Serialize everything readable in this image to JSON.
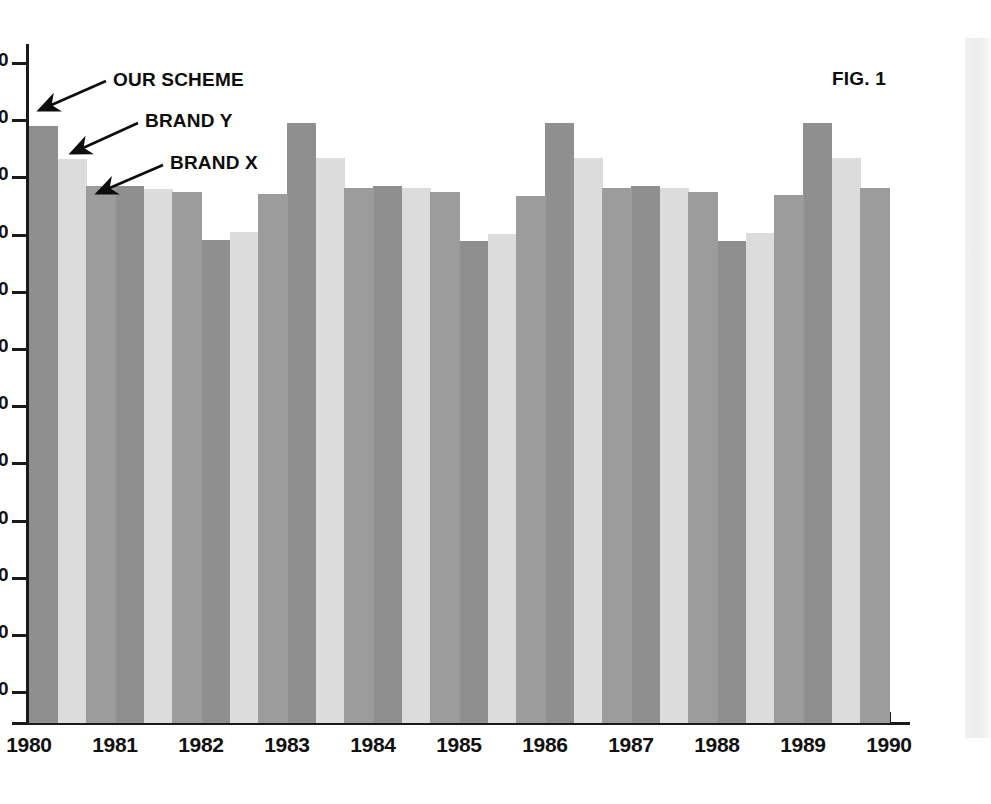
{
  "figure": {
    "number_label": "FIG. 1"
  },
  "annotations": [
    {
      "text": "OUR SCHEME",
      "series": "our-scheme"
    },
    {
      "text": "BRAND Y",
      "series": "brand-y"
    },
    {
      "text": "BRAND X",
      "series": "brand-x"
    }
  ],
  "colors": {
    "our_scheme": "#8f8f8f",
    "brand_y": "#dcdcdc",
    "brand_x": "#9c9c9c",
    "axis": "#1a1a1a",
    "text": "#0d0d0d",
    "background": "#ffffff"
  },
  "chart_data": {
    "type": "bar",
    "title": "FIG. 1",
    "xlabel": "",
    "ylabel": "",
    "grid": false,
    "legend_position": "annotated-arrows",
    "categories": [
      "1980",
      "1981",
      "1982",
      "1983",
      "1984",
      "1985",
      "1986",
      "1987",
      "1988",
      "1989"
    ],
    "axis_tick_labels_x": [
      "1980",
      "1981",
      "1982",
      "1983",
      "1984",
      "1985",
      "1986",
      "1987",
      "1988",
      "1989",
      "1990"
    ],
    "y_tick_labels": [
      "0",
      "0",
      "0",
      "0",
      "0",
      "0",
      "0",
      "0",
      "0",
      "0",
      "0",
      "0"
    ],
    "y_tick_note": "Y-axis numeric labels are clipped by the left edge of the image; only the trailing digit glyph is visible.",
    "ylim": [
      0,
      100
    ],
    "series": [
      {
        "name": "OUR SCHEME",
        "key": "our-scheme",
        "color": "#8f8f8f",
        "values": [
          88,
          82,
          72,
          89,
          81,
          72,
          89,
          81,
          72,
          89
        ]
      },
      {
        "name": "BRAND Y",
        "key": "brand-y",
        "color": "#dcdcdc",
        "values": [
          84,
          81,
          74,
          84,
          81,
          75,
          84,
          81,
          75,
          84
        ]
      },
      {
        "name": "BRAND X",
        "key": "brand-x",
        "color": "#9c9c9c",
        "values": [
          81,
          81,
          81,
          80,
          81,
          81,
          81,
          80,
          81,
          80
        ]
      }
    ]
  },
  "plot_geometry": {
    "bar_tops_px": {
      "our-scheme": [
        126,
        186,
        240,
        123,
        186,
        241,
        123,
        186,
        241,
        123
      ],
      "brand-y": [
        159,
        189,
        232,
        158,
        188,
        234,
        158,
        188,
        233,
        158
      ],
      "brand-x": [
        186,
        192,
        194,
        188,
        192,
        196,
        188,
        192,
        195,
        188
      ]
    },
    "baseline_y_px": 723,
    "plot_left_px": 29,
    "plot_right_px": 889,
    "group_count": 10,
    "bars_per_group": 3
  }
}
